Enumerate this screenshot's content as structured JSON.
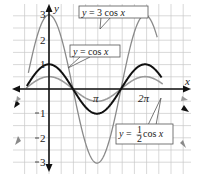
{
  "chart_data": {
    "type": "line",
    "title": "",
    "xlabel": "x",
    "ylabel": "y",
    "xlim": [
      -1.571,
      7.45
    ],
    "ylim": [
      -3.4,
      3.5
    ],
    "grid": true,
    "x_ticks": [
      {
        "value": 3.1416,
        "label": "π"
      },
      {
        "value": 6.2832,
        "label": "2π"
      }
    ],
    "y_ticks": [
      {
        "value": 3,
        "label": "3"
      },
      {
        "value": 2,
        "label": "2"
      },
      {
        "value": 1,
        "label": "1"
      },
      {
        "value": -1,
        "label": "1"
      },
      {
        "value": -2,
        "label": "2"
      },
      {
        "value": -3,
        "label": "3"
      }
    ],
    "series": [
      {
        "name": "y = 3 cos x",
        "function": "3*cos(x)",
        "amplitude": 3,
        "color": "#8a8a8a",
        "width": 1.3
      },
      {
        "name": "y = cos x",
        "function": "cos(x)",
        "amplitude": 1,
        "color": "#111111",
        "width": 2.0
      },
      {
        "name": "y = 1/2 cos x",
        "function": "0.5*cos(x)",
        "amplitude": 0.5,
        "color": "#9a9a9a",
        "width": 1.6
      }
    ],
    "annotations": [
      {
        "text_parts": [
          "y",
          " = 3 cos ",
          "x"
        ],
        "target": "y = 3 cos x"
      },
      {
        "text_parts": [
          "y",
          " = cos ",
          "x"
        ],
        "target": "y = cos x"
      },
      {
        "text_parts": [
          "y",
          " = ",
          "1",
          "2",
          " cos ",
          "x"
        ],
        "target": "y = 1/2 cos x"
      }
    ]
  },
  "labels": {
    "x_axis": "x",
    "y_axis": "y",
    "pi": "π",
    "two_pi": "2π",
    "y3": "3",
    "y2": "2",
    "y1": "1",
    "yn1": "1",
    "yn2": "2",
    "yn3": "3"
  },
  "boxes": {
    "three_cos": {
      "y": "y",
      "eq": " = 3 cos ",
      "x": "x"
    },
    "cos": {
      "y": "y",
      "eq": " = cos ",
      "x": "x"
    },
    "half_cos": {
      "y": "y",
      "eq": " = ",
      "num": "1",
      "den": "2",
      "cos": " cos ",
      "x": "x"
    }
  },
  "colors": {
    "grid": "#c8c8c8",
    "axis": "#111111",
    "three_cos": "#8a8a8a",
    "cos": "#111111",
    "half_cos": "#9a9a9a"
  }
}
